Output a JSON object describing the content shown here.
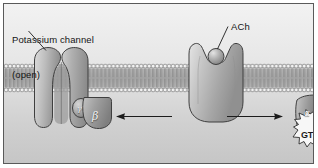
{
  "figure": {
    "background_color": "#e3e3e3",
    "border_color": "#5a5a5a"
  },
  "labels": {
    "potassium_channel": "Potassium channel\n(open)",
    "potassium_channel_line1": "Potassium channel",
    "potassium_channel_line2": "(open)",
    "ach": "ACh",
    "gtp": "GTP"
  },
  "subunits": {
    "alpha": "α",
    "beta": "β",
    "gamma": "γ"
  },
  "structures": [
    {
      "name": "potassium-channel",
      "label": "Potassium channel (open)",
      "state": "open"
    },
    {
      "name": "g-protein-beta-gamma",
      "label": "βγ subunit complex"
    },
    {
      "name": "acetylcholine-receptor",
      "label": "ACh receptor"
    },
    {
      "name": "acetylcholine-molecule",
      "label": "ACh"
    },
    {
      "name": "g-protein-alpha-gtp",
      "label": "α subunit with GTP"
    }
  ],
  "arrows": [
    {
      "name": "arrow-left",
      "direction": "left"
    },
    {
      "name": "arrow-right",
      "direction": "right"
    }
  ],
  "membrane": {
    "name": "phospholipid-bilayer",
    "description": "lipid bilayer with two rows of head groups and inward-facing tails"
  },
  "colors": {
    "protein_light": "#d8d8d8",
    "protein_mid": "#b4b4b4",
    "protein_dark": "#8e8e8e",
    "outline": "#3c3c3c",
    "membrane_head": "#f0f0f0",
    "text": "#141414"
  }
}
